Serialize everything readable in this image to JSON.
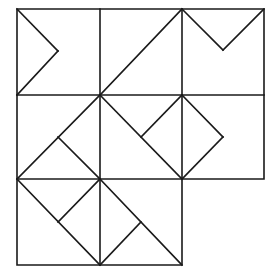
{
  "diagram": {
    "stroke_color": "#1a1a1a",
    "background": "#ffffff",
    "grid": {
      "x": [
        17,
        100,
        182,
        264
      ],
      "y": [
        9,
        95,
        179,
        265
      ],
      "rows": [
        3,
        3,
        2
      ]
    },
    "cells": [
      {
        "row": 1,
        "col": 1,
        "shape": "chevron-right",
        "segments": [
          [
            17,
            9,
            58,
            51
          ],
          [
            58,
            51,
            17,
            95
          ]
        ]
      },
      {
        "row": 1,
        "col": 2,
        "shape": "diagonal",
        "segments": [
          [
            100,
            95,
            182,
            9
          ]
        ]
      },
      {
        "row": 1,
        "col": 3,
        "shape": "chevron-down",
        "segments": [
          [
            182,
            9,
            223,
            50
          ],
          [
            223,
            50,
            264,
            9
          ]
        ]
      },
      {
        "row": 2,
        "col": 1,
        "shape": "diagonal-with-branch",
        "segments": [
          [
            17,
            179,
            100,
            95
          ],
          [
            58,
            137,
            100,
            179
          ]
        ]
      },
      {
        "row": 2,
        "col": 2,
        "shape": "diagonal-with-branch",
        "segments": [
          [
            100,
            95,
            182,
            179
          ],
          [
            141,
            137,
            182,
            95
          ]
        ]
      },
      {
        "row": 2,
        "col": 3,
        "shape": "chevron-right",
        "segments": [
          [
            182,
            95,
            223,
            137
          ],
          [
            223,
            137,
            182,
            179
          ]
        ]
      },
      {
        "row": 3,
        "col": 1,
        "shape": "diagonal-with-branch",
        "segments": [
          [
            17,
            179,
            100,
            265
          ],
          [
            58,
            222,
            100,
            179
          ]
        ]
      },
      {
        "row": 3,
        "col": 2,
        "shape": "diagonal-with-branch",
        "segments": [
          [
            100,
            179,
            182,
            265
          ],
          [
            141,
            222,
            100,
            265
          ]
        ]
      }
    ]
  }
}
